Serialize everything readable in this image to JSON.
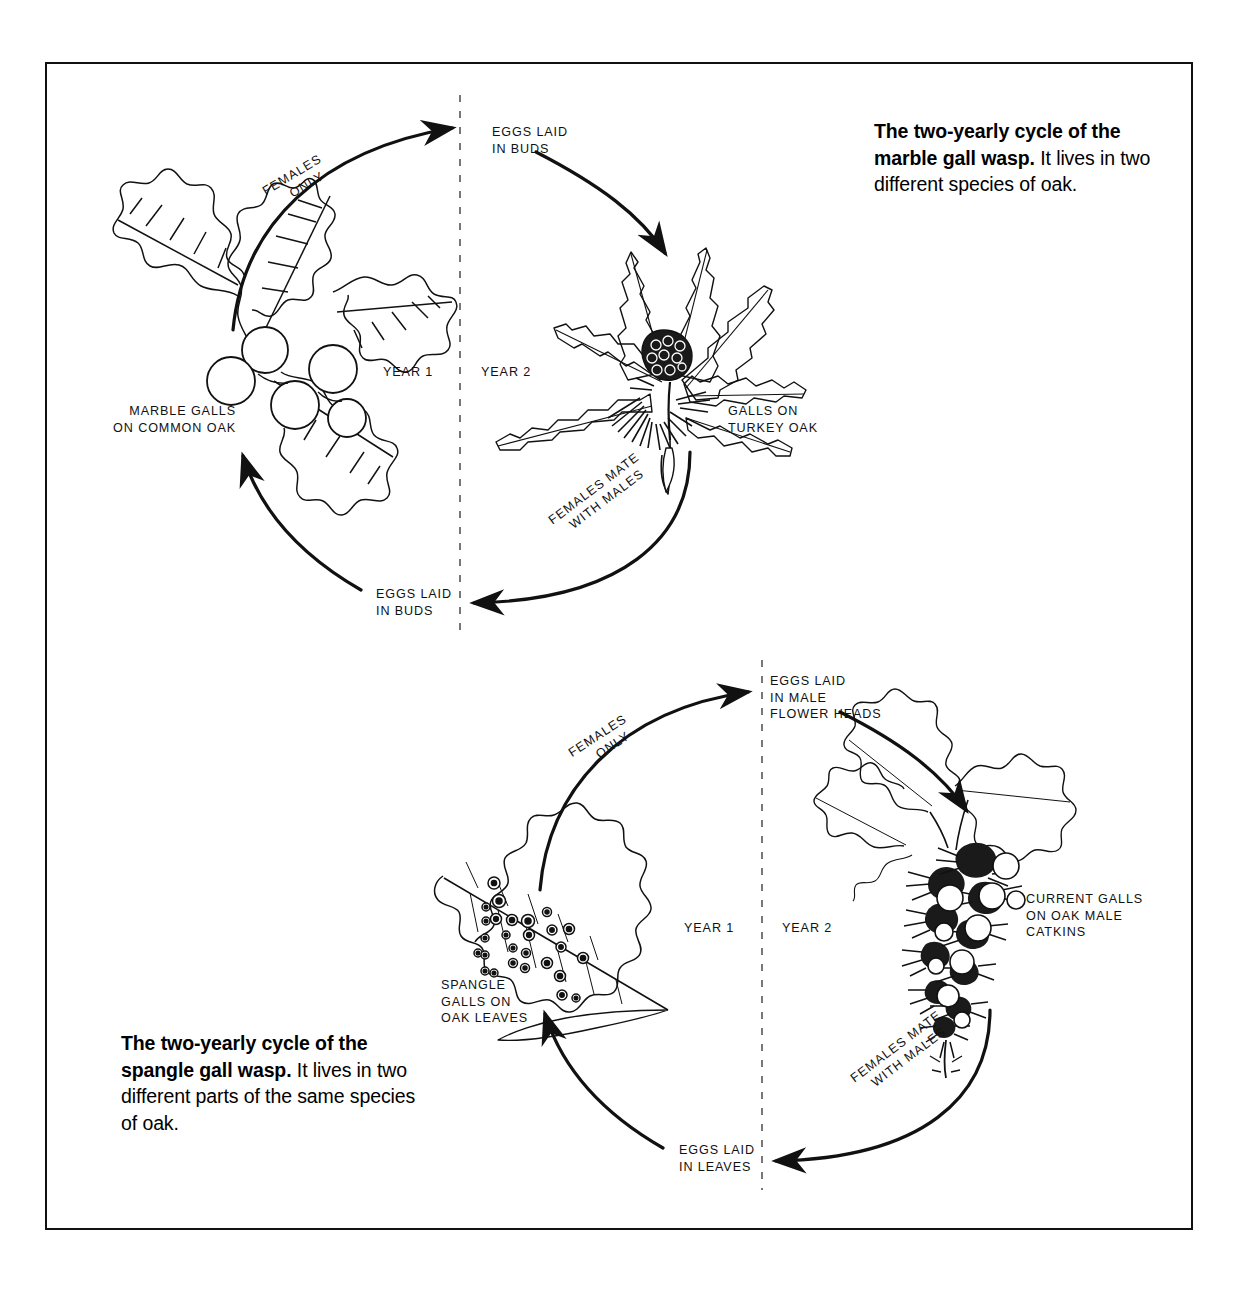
{
  "figure": {
    "border_color": "#111111",
    "background": "#ffffff"
  },
  "captions": {
    "marble": {
      "bold": "The two-yearly cycle of the marble gall wasp.",
      "rest": " It lives in two different species of oak.",
      "line1_bold": "The two-yearly cycle of",
      "line2_bold": "the marble gall wasp.",
      "line2_rest": " It",
      "line3": "lives in two different",
      "line4": "species of oak."
    },
    "spangle": {
      "bold": "The two-yearly cycle of the spangle gall wasp.",
      "rest": " It lives in two different parts of the same species of oak.",
      "line1_bold": "The two-yearly cycle of",
      "line2_bold": "the spangle gall wasp.",
      "line2_rest": " It",
      "line3": "lives in two different parts",
      "line4": "of the same species",
      "line5": "of oak."
    }
  },
  "marble_cycle": {
    "name": "marble gall wasp cycle",
    "year1_label": "YEAR 1",
    "year2_label": "YEAR 2",
    "top_label_line1": "EGGS LAID",
    "top_label_line2": "IN BUDS",
    "bottom_label_line1": "EGGS LAID",
    "bottom_label_line2": "IN BUDS",
    "left_illustration_line1": "MARBLE GALLS",
    "left_illustration_line2": "ON COMMON OAK",
    "right_illustration_line1": "GALLS ON",
    "right_illustration_line2": "TURKEY OAK",
    "arc_top_line1": "FEMALES",
    "arc_top_line2": "ONLY",
    "arc_bottom_line1": "FEMALES MATE",
    "arc_bottom_line2": "WITH MALES"
  },
  "spangle_cycle": {
    "name": "spangle gall wasp cycle",
    "year1_label": "YEAR 1",
    "year2_label": "YEAR 2",
    "top_label_line1": "EGGS LAID",
    "top_label_line2": "IN MALE",
    "top_label_line3": "FLOWER HEADS",
    "bottom_label_line1": "EGGS LAID",
    "bottom_label_line2": "IN LEAVES",
    "left_illustration_line1": "SPANGLE",
    "left_illustration_line2": "GALLS ON",
    "left_illustration_line3": "OAK LEAVES",
    "right_illustration_line1": "CURRENT GALLS",
    "right_illustration_line2": "ON OAK MALE",
    "right_illustration_line3": "CATKINS",
    "arc_top_line1": "FEMALES",
    "arc_top_line2": "ONLY",
    "arc_bottom_line1": "FEMALES MATE",
    "arc_bottom_line2": "WITH MALES"
  }
}
